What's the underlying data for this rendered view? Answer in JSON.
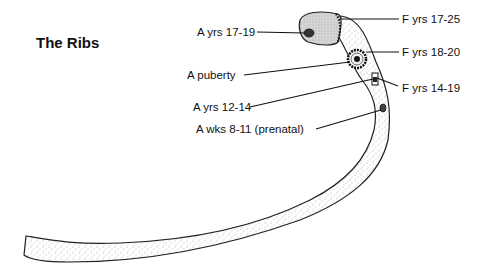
{
  "title": "The Ribs",
  "labels": {
    "a_17_19": "A yrs 17-19",
    "a_puberty": "A puberty",
    "a_12_14": "A yrs 12-14",
    "a_wks_8_11": "A wks 8-11 (prenatal)",
    "f_17_25": "F yrs 17-25",
    "f_18_20": "F yrs 18-20",
    "f_14_19": "F yrs 14-19"
  },
  "legend": {
    "A": "appearance",
    "F": "fusion"
  }
}
